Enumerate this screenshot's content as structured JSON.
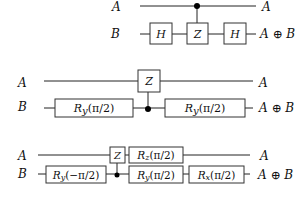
{
  "circuits": [
    {
      "id": "circuit-1",
      "input_labels": {
        "a": "A",
        "b": "B"
      },
      "output_labels": {
        "a": "A",
        "b": "A ⊕ B"
      },
      "gates": [
        {
          "qubit": "B",
          "label": "H"
        },
        {
          "qubit": "B",
          "label": "Z",
          "control": "A"
        },
        {
          "qubit": "B",
          "label": "H"
        }
      ]
    },
    {
      "id": "circuit-2",
      "input_labels": {
        "a": "A",
        "b": "B"
      },
      "output_labels": {
        "a": "A",
        "b": "A ⊕ B"
      },
      "gates": [
        {
          "qubit": "B",
          "label": "Ry(π/2)"
        },
        {
          "qubit": "A",
          "label": "Z",
          "control": "B"
        },
        {
          "qubit": "B",
          "label": "Ry(π/2)"
        }
      ]
    },
    {
      "id": "circuit-3",
      "input_labels": {
        "a": "A",
        "b": "B"
      },
      "output_labels": {
        "a": "A",
        "b": "A ⊕ B"
      },
      "gates": [
        {
          "qubit": "B",
          "label": "Ry(−π/2)"
        },
        {
          "qubit": "A",
          "label": "Z",
          "control": "B"
        },
        {
          "qubit": "A",
          "label": "Rz(π/2)"
        },
        {
          "qubit": "B",
          "label": "Ry(π/2)"
        },
        {
          "qubit": "B",
          "label": "Rx(π/2)"
        }
      ]
    }
  ],
  "text": {
    "c1": {
      "in_a": "A",
      "in_b": "B",
      "out_a": "A",
      "out_b": "A ⊕ B",
      "g1": "H",
      "g2": "Z",
      "g3": "H"
    },
    "c2": {
      "in_a": "A",
      "in_b": "B",
      "out_a": "A",
      "out_b": "A ⊕ B",
      "g1_base": "R",
      "g1_sub": "y",
      "g1_arg": "(π/2)",
      "g2": "Z",
      "g3_base": "R",
      "g3_sub": "y",
      "g3_arg": "(π/2)"
    },
    "c3": {
      "in_a": "A",
      "in_b": "B",
      "out_a": "A",
      "out_b": "A ⊕ B",
      "g1_base": "R",
      "g1_sub": "y",
      "g1_arg": "(−π/2)",
      "g2": "Z",
      "g3_base": "R",
      "g3_sub": "z",
      "g3_arg": "(π/2)",
      "g4_base": "R",
      "g4_sub": "y",
      "g4_arg": "(π/2)",
      "g5_base": "R",
      "g5_sub": "x",
      "g5_arg": "(π/2)"
    }
  }
}
